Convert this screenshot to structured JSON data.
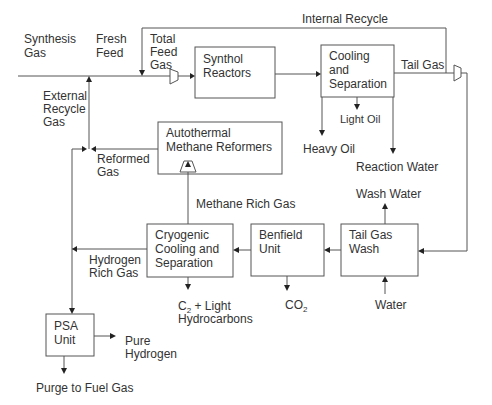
{
  "diagram": {
    "units": {
      "synthol_reactors": [
        "Synthol",
        "Reactors"
      ],
      "cooling_separation": [
        "Cooling",
        "and",
        "Separation"
      ],
      "autothermal_reformers": [
        "Autothermal",
        "Methane Reformers"
      ],
      "cryogenic": [
        "Cryogenic",
        "Cooling and",
        "Separation"
      ],
      "benfield": [
        "Benfield",
        "Unit"
      ],
      "tail_gas_wash": [
        "Tail Gas",
        "Wash"
      ],
      "psa": [
        "PSA",
        "Unit"
      ]
    },
    "streams": {
      "synthesis_gas": [
        "Synthesis",
        "Gas"
      ],
      "fresh_feed": [
        "Fresh",
        "Feed"
      ],
      "total_feed_gas": [
        "Total",
        "Feed",
        "Gas"
      ],
      "internal_recycle": "Internal Recycle",
      "tail_gas": "Tail Gas",
      "external_recycle_gas": [
        "External",
        "Recycle",
        "Gas"
      ],
      "light_oil": "Light Oil",
      "heavy_oil": "Heavy Oil",
      "reaction_water": "Reaction Water",
      "reformed_gas": [
        "Reformed",
        "Gas"
      ],
      "methane_rich_gas": "Methane Rich Gas",
      "wash_water": "Wash Water",
      "hydrogen_rich_gas": [
        "Hydrogen",
        "Rich Gas"
      ],
      "c2_light_hc": {
        "prefix": "C",
        "subscript": "2",
        "suffix": " + Light",
        "line2": "Hydrocarbons"
      },
      "co2": {
        "prefix": "CO",
        "subscript": "2"
      },
      "water": "Water",
      "pure_hydrogen": [
        "Pure",
        "Hydrogen"
      ],
      "purge_fuel_gas": "Purge to Fuel Gas"
    }
  }
}
